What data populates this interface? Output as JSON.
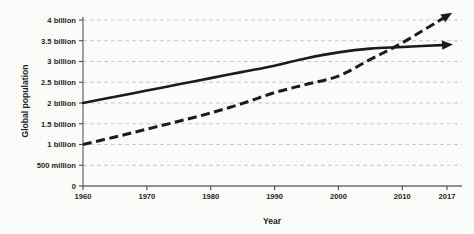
{
  "chart_data": {
    "type": "line",
    "title": "",
    "xlabel": "Year",
    "ylabel": "Global population",
    "xlim": [
      1960,
      2017
    ],
    "ylim": [
      0,
      4000000000
    ],
    "grid": true,
    "legend": "none",
    "x_ticks": [
      "1960",
      "1970",
      "1980",
      "1990",
      "2000",
      "2010",
      "2017"
    ],
    "x_tick_values": [
      1960,
      1970,
      1980,
      1990,
      2000,
      2010,
      2017
    ],
    "y_ticks": [
      "0",
      "500 million",
      "1 billion",
      "1.5 billion",
      "2 billion",
      "2.5 billion",
      "3 billion",
      "3.5 billion",
      "4 billion"
    ],
    "y_tick_values": [
      0,
      500000000,
      1000000000,
      1500000000,
      2000000000,
      2500000000,
      3000000000,
      3500000000,
      4000000000
    ],
    "series": [
      {
        "name": "solid-series",
        "style": "solid",
        "color": "#1b1b1d",
        "end_marker": "arrow",
        "x": [
          1960,
          1965,
          1970,
          1975,
          1980,
          1985,
          1990,
          1995,
          2000,
          2005,
          2010,
          2017
        ],
        "values": [
          2000000000,
          2150000000,
          2300000000,
          2450000000,
          2600000000,
          2750000000,
          2900000000,
          3080000000,
          3220000000,
          3310000000,
          3350000000,
          3400000000
        ]
      },
      {
        "name": "dashed-series",
        "style": "dashed",
        "color": "#1b1b1d",
        "end_marker": "arrow",
        "x": [
          1960,
          1965,
          1970,
          1975,
          1980,
          1985,
          1990,
          1995,
          2000,
          2005,
          2010,
          2017
        ],
        "values": [
          1000000000,
          1180000000,
          1370000000,
          1560000000,
          1760000000,
          1990000000,
          2250000000,
          2450000000,
          2650000000,
          3050000000,
          3450000000,
          4100000000
        ]
      }
    ]
  }
}
